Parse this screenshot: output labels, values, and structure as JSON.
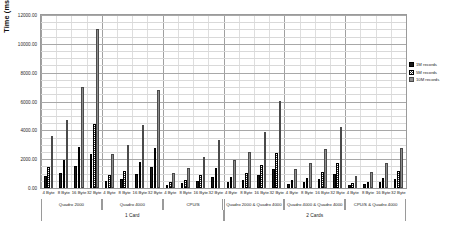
{
  "chart_data": {
    "type": "bar",
    "title": "",
    "xlabel": "",
    "ylabel": "Time (ms)",
    "ylim": [
      0,
      12000
    ],
    "grid": true,
    "legend_position": "right",
    "ytick_labels": [
      "12000.00",
      "10000.00",
      "8000.00",
      "6000.00",
      "4000.00",
      "2000.00",
      "0.00"
    ],
    "ytick_values": [
      12000,
      10000,
      8000,
      6000,
      4000,
      2000,
      0
    ],
    "categories": [
      "4 Byte",
      "8 Byte",
      "16 Byte",
      "32 Byte",
      "4 Byte",
      "8 Byte",
      "16 Byte",
      "32 Byte",
      "4 Byte",
      "8 Byte",
      "16 Byte",
      "32 Byte",
      "4 Byte",
      "8 Byte",
      "16 Byte",
      "32 Byte",
      "4 Byte",
      "8 Byte",
      "16 Byte",
      "32 Byte",
      "4 Byte",
      "8 Byte",
      "16 Byte",
      "32 Byte"
    ],
    "groups": [
      {
        "label": "Quadro 2000",
        "span": 4
      },
      {
        "label": "Quadro 4000",
        "span": 4
      },
      {
        "label": "CPU/S",
        "span": 4
      },
      {
        "label": "Quadro 2000 & Quadro 4000",
        "span": 4
      },
      {
        "label": "Quadro 4000 & Quadro 4000",
        "span": 4
      },
      {
        "label": "CPU/S & Quadro 4000",
        "span": 4
      }
    ],
    "supergroups": [
      {
        "label": "1 Card",
        "span": 12
      },
      {
        "label": "2 Cards",
        "span": 12
      }
    ],
    "series": [
      {
        "name": "1M records",
        "swatch": "#1a1a1a",
        "pattern": "solid",
        "values": [
          820,
          1050,
          1530,
          2380,
          490,
          620,
          960,
          1470,
          230,
          330,
          520,
          790,
          440,
          560,
          880,
          1340,
          300,
          390,
          620,
          960,
          190,
          260,
          420,
          660
        ]
      },
      {
        "name": "5M records",
        "swatch": "#3a3a3a",
        "pattern": "checker",
        "values": [
          1480,
          1930,
          2860,
          4460,
          920,
          1190,
          1780,
          2760,
          410,
          560,
          880,
          1390,
          780,
          1020,
          1580,
          2460,
          530,
          700,
          1090,
          1720,
          330,
          450,
          720,
          1150
        ]
      },
      {
        "name": "10M records",
        "swatch": "#8e8e8e",
        "pattern": "solid",
        "values": [
          3620,
          4740,
          7020,
          11020,
          2330,
          2980,
          4380,
          6830,
          1020,
          1380,
          2150,
          3340,
          1940,
          2520,
          3870,
          6020,
          1300,
          1720,
          2680,
          4200,
          810,
          1100,
          1760,
          2800
        ]
      }
    ]
  }
}
